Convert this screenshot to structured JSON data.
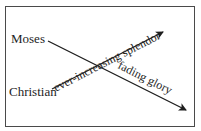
{
  "diagram": {
    "nodes": {
      "moses": "Moses",
      "christian": "Christian"
    },
    "arrows": [
      {
        "from": "Moses",
        "label": "fading glory",
        "direction": "down-right"
      },
      {
        "from": "Christian",
        "label": "ever-increasing splendor",
        "direction": "up-right"
      }
    ],
    "labels": {
      "rising": "ever-increasing splendor",
      "falling": "fading glory"
    },
    "colors": {
      "line": "#1e1e1e",
      "frame": "#4a4a4a"
    }
  }
}
